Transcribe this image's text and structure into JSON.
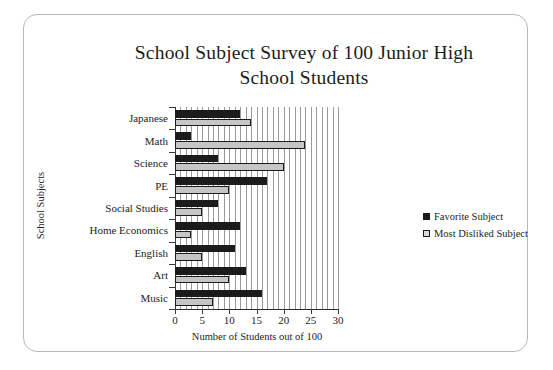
{
  "chart_data": {
    "type": "bar",
    "orientation": "horizontal",
    "title": "School Subject Survey of 100 Junior High School Students",
    "title_lines": [
      "School Subject Survey of 100 Junior High",
      "School Students"
    ],
    "xlabel": "Number of Students out of 100",
    "ylabel": "School Subjects",
    "categories": [
      "Japanese",
      "Math",
      "Science",
      "PE",
      "Social Studies",
      "Home Economics",
      "English",
      "Art",
      "Music"
    ],
    "series": [
      {
        "name": "Favorite Subject",
        "color": "#1b1b1b",
        "values": [
          12,
          3,
          8,
          17,
          8,
          12,
          11,
          13,
          16
        ]
      },
      {
        "name": "Most Disliked Subject",
        "color": "#c6c6c6",
        "values": [
          14,
          24,
          20,
          10,
          5,
          3,
          5,
          10,
          7
        ]
      }
    ],
    "xlim": [
      0,
      30
    ],
    "xticks": [
      0,
      5,
      10,
      15,
      20,
      25,
      30
    ],
    "xtick_labels": [
      "0",
      "5",
      "10",
      "15",
      "20",
      "25",
      "30"
    ],
    "x_minor_step": 1,
    "grid": "vertical-minor",
    "legend_position": "right"
  }
}
